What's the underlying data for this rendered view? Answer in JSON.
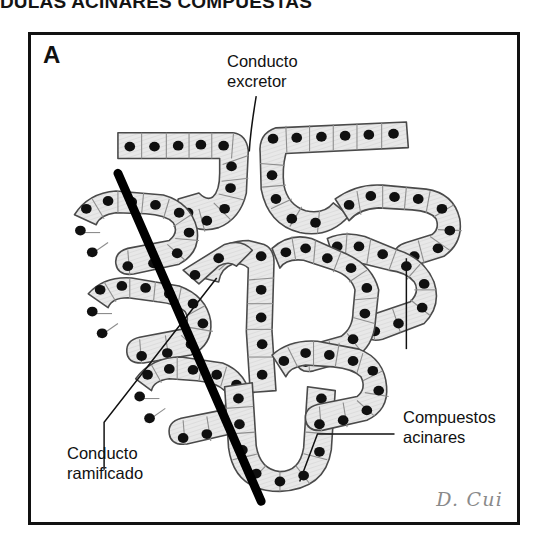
{
  "page": {
    "title_clipped": "NDULAS ACINARES COMPUESTAS"
  },
  "figure": {
    "panel_letter": "A",
    "signature": "D. Cui",
    "colors": {
      "frame_border": "#111111",
      "cell_fill": "#e6e6e6",
      "cell_outline": "#4a4a4a",
      "nucleus": "#101010",
      "section_line": "#000000",
      "leader_line": "#111111",
      "background": "#ffffff",
      "signature_text": "#8a8a8a"
    },
    "annotations": [
      {
        "id": "conducto-excretor",
        "line1": "Conducto",
        "line2": "excretor"
      },
      {
        "id": "conducto-ramificado",
        "line1": "Conducto",
        "line2": "ramificado"
      },
      {
        "id": "compuestos-acinares",
        "line1": "Compuestos",
        "line2": "acinares"
      }
    ]
  }
}
